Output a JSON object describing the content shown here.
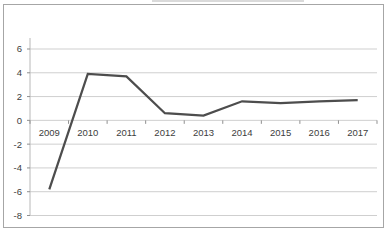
{
  "chart_style": {
    "background": "#ffffff",
    "frame_border": "#a6a6a6",
    "gridline_color": "#cfcfcf",
    "axis_line_color": "#b8b8b8",
    "tick_color": "#8f8f8f",
    "series_line_color": "#4d4d4d",
    "label_color": "#3d3d3d"
  },
  "chart_data": {
    "type": "line",
    "title": "",
    "categories": [
      "2009",
      "2010",
      "2011",
      "2012",
      "2013",
      "2014",
      "2015",
      "2016",
      "2017"
    ],
    "values": [
      -5.8,
      3.9,
      3.7,
      0.6,
      0.4,
      1.6,
      1.45,
      1.6,
      1.7
    ],
    "xlabel": "",
    "ylabel": "",
    "ylim": [
      -8,
      6
    ],
    "yticks": [
      6,
      4,
      2,
      0,
      -2,
      -4,
      -6,
      -8
    ],
    "ytick_step": 2,
    "grid": true,
    "legend": false,
    "x_label_position": "below-zero-axis"
  }
}
